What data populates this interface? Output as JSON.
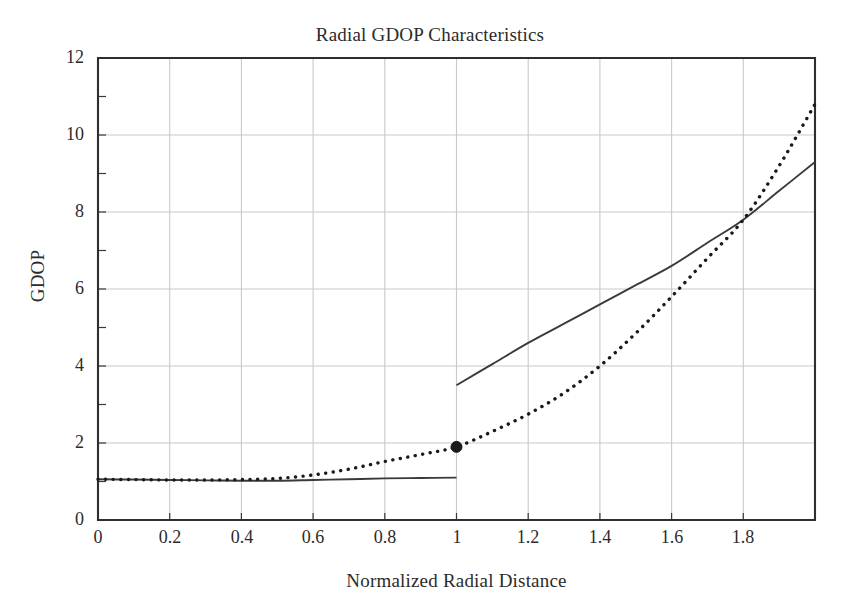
{
  "chart_data": {
    "type": "line",
    "title": "Radial GDOP Characteristics",
    "xlabel": "Normalized Radial Distance",
    "ylabel": "GDOP",
    "xlim": [
      0,
      2
    ],
    "ylim": [
      0,
      12
    ],
    "grid": true,
    "legend": "none",
    "xticks": [
      0,
      0.2,
      0.4,
      0.6,
      0.8,
      1,
      1.2,
      1.4,
      1.6,
      1.8
    ],
    "xtick_labels": [
      "0",
      "0.2",
      "0.4",
      "0.6",
      "0.8",
      "1",
      "1.2",
      "1.4",
      "1.6",
      "1.8"
    ],
    "yticks": [
      0,
      2,
      4,
      6,
      8,
      10,
      12
    ],
    "ytick_labels": [
      "0",
      "2",
      "4",
      "6",
      "8",
      "10",
      "12"
    ],
    "x_minor_tick_interval": 0.1,
    "y_minor_tick_interval": 1,
    "series": [
      {
        "name": "solid-curve",
        "style": "solid",
        "color": "#3a3a3a",
        "discontinuous": true,
        "segments": [
          {
            "name": "inside-region",
            "x": [
              0.0,
              0.1,
              0.2,
              0.3,
              0.4,
              0.5,
              0.6,
              0.7,
              0.8,
              0.9,
              1.0
            ],
            "y": [
              1.06,
              1.05,
              1.04,
              1.03,
              1.02,
              1.02,
              1.04,
              1.06,
              1.08,
              1.09,
              1.1
            ]
          },
          {
            "name": "outside-region",
            "x": [
              1.0,
              1.1,
              1.2,
              1.3,
              1.4,
              1.5,
              1.6,
              1.7,
              1.8,
              1.9,
              2.0
            ],
            "y": [
              3.5,
              4.05,
              4.6,
              5.1,
              5.6,
              6.1,
              6.6,
              7.2,
              7.8,
              8.55,
              9.3
            ]
          }
        ]
      },
      {
        "name": "dotted-curve",
        "style": "dotted",
        "color": "#1a1a1a",
        "discontinuous": false,
        "segments": [
          {
            "name": "full-range",
            "x": [
              0.0,
              0.1,
              0.2,
              0.3,
              0.4,
              0.5,
              0.6,
              0.7,
              0.8,
              0.9,
              1.0,
              1.1,
              1.2,
              1.3,
              1.4,
              1.5,
              1.6,
              1.7,
              1.8,
              1.9,
              2.0
            ],
            "y": [
              1.06,
              1.05,
              1.04,
              1.04,
              1.05,
              1.08,
              1.17,
              1.32,
              1.52,
              1.7,
              1.9,
              2.3,
              2.75,
              3.3,
              4.0,
              4.85,
              5.8,
              6.8,
              7.8,
              9.2,
              10.8
            ]
          }
        ]
      }
    ],
    "markers": [
      {
        "name": "transition-point",
        "x": 1.0,
        "y": 1.9,
        "shape": "filled-circle",
        "color": "#1a1a1a",
        "size": 11
      }
    ],
    "annotations": []
  }
}
